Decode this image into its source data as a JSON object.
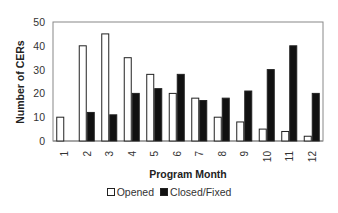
{
  "chart_data": {
    "type": "bar",
    "title": "",
    "xlabel": "Program Month",
    "ylabel": "Number of CERs",
    "ylim": [
      0,
      50
    ],
    "yticks": [
      0,
      10,
      20,
      30,
      40,
      50
    ],
    "grid": false,
    "legend_position": "bottom",
    "categories": [
      "1",
      "2",
      "3",
      "4",
      "5",
      "6",
      "7",
      "8",
      "9",
      "10",
      "11",
      "12"
    ],
    "series": [
      {
        "name": "Opened",
        "color": "#ffffff",
        "values": [
          10,
          40,
          45,
          35,
          28,
          20,
          18,
          10,
          8,
          5,
          4,
          2
        ]
      },
      {
        "name": "Closed/Fixed",
        "color": "#111111",
        "values": [
          0,
          12,
          11,
          20,
          22,
          28,
          17,
          18,
          21,
          30,
          40,
          20
        ]
      }
    ]
  },
  "legend": {
    "opened_label": "Opened",
    "closed_label": "Closed/Fixed"
  }
}
